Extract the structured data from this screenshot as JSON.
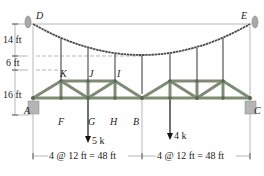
{
  "figure": {
    "type": "suspension cable supporting truss",
    "colors": {
      "truss_member": "#8a9580",
      "truss_outline": "#5b6656",
      "cable": "#4a4a4a",
      "hanger": "#555555",
      "support": "#a8a8a8",
      "dimension_line": "#9a9a9a",
      "text": "#222222"
    }
  },
  "points": {
    "D": "D",
    "E": "E",
    "K": "K",
    "J": "J",
    "I": "I",
    "A": "A",
    "F": "F",
    "G": "G",
    "H": "H",
    "B": "B",
    "C": "C"
  },
  "dimensions": {
    "sag": "14 ft",
    "hanger_gap": "6 ft",
    "truss_height": "16 ft",
    "left_span": "4 @ 12 ft = 48 ft",
    "right_span": "4 @ 12 ft = 48 ft"
  },
  "loads": {
    "at_G": "5 k",
    "right_panel": "4 k"
  }
}
